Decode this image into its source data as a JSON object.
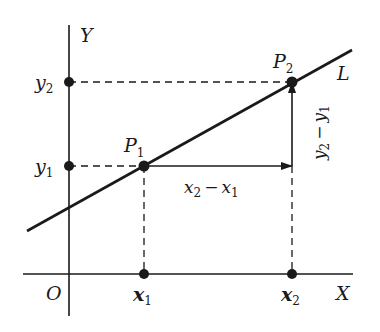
{
  "diagram": {
    "type": "coordinate-geometry",
    "colors": {
      "ink": "#1a1a1a",
      "background": "#ffffff"
    },
    "axes": {
      "x_label": "X",
      "y_label": "Y",
      "origin_label": "O"
    },
    "line": {
      "label": "L"
    },
    "points": [
      {
        "name": "P",
        "sub": "1",
        "role": "first point on L"
      },
      {
        "name": "P",
        "sub": "2",
        "role": "second point on L"
      }
    ],
    "ticks": {
      "x1": {
        "base": "x",
        "sub": "1"
      },
      "x2": {
        "base": "x",
        "sub": "2"
      },
      "y1": {
        "base": "y",
        "sub": "1"
      },
      "y2": {
        "base": "y",
        "sub": "2"
      }
    },
    "run": {
      "a": "x",
      "a_sub": "2",
      "op": "−",
      "b": "x",
      "b_sub": "1"
    },
    "rise": {
      "a": "y",
      "a_sub": "2",
      "op": "−",
      "b": "y",
      "b_sub": "1"
    }
  }
}
